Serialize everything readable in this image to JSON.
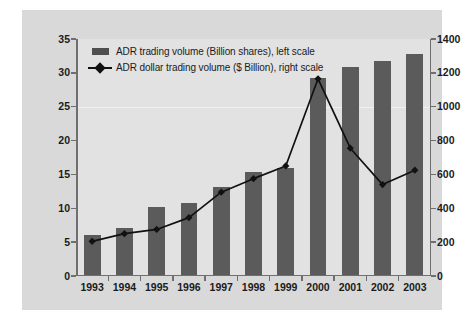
{
  "chart_data": {
    "type": "bar",
    "title": "",
    "subtitle": "",
    "xlabel": "",
    "ylabel": "",
    "categories": [
      "1993",
      "1994",
      "1995",
      "1996",
      "1997",
      "1998",
      "1999",
      "2000",
      "2001",
      "2002",
      "2003"
    ],
    "series": [
      {
        "name": "ADR trading volume (Billion shares), left scale",
        "type": "bar",
        "axis": "left",
        "unit": "Billion shares",
        "color": "#5b5b5b",
        "values": [
          6.1,
          7.1,
          10.2,
          10.8,
          13.2,
          15.3,
          16.0,
          29.2,
          30.9,
          31.8,
          32.8
        ]
      },
      {
        "name": "ADR dollar trading volume ($ Billion), right scale",
        "type": "line",
        "axis": "right",
        "unit": "$ Billion",
        "color": "#111111",
        "marker": "diamond",
        "values": [
          205,
          250,
          275,
          345,
          495,
          575,
          650,
          1165,
          755,
          540,
          625
        ]
      }
    ],
    "left_axis": {
      "ticks": [
        "0",
        "5",
        "10",
        "15",
        "20",
        "25",
        "30",
        "35"
      ],
      "values": [
        0,
        5,
        10,
        15,
        20,
        25,
        30,
        35
      ],
      "ylim": [
        0,
        35
      ]
    },
    "right_axis": {
      "ticks": [
        "0",
        "200",
        "400",
        "600",
        "800",
        "1000",
        "1200",
        "1400"
      ],
      "values": [
        0,
        200,
        400,
        600,
        800,
        1000,
        1200,
        1400
      ],
      "ylim": [
        0,
        1400
      ]
    },
    "legend": {
      "position": "top-left",
      "entries": [
        {
          "label": "ADR trading volume (Billion shares), left scale",
          "marker": "bar-swatch"
        },
        {
          "label": "ADR dollar trading volume ($ Billion), right scale",
          "marker": "line-diamond-swatch"
        }
      ]
    },
    "grid": false,
    "plot_background": "#e2e2e2",
    "panel_background": "#d9d9d9"
  }
}
